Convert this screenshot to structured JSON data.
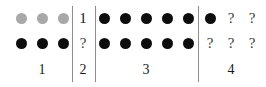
{
  "figure": {
    "title": "",
    "background_color": "#ffffff",
    "colors": {
      "dot_black": "#0d0d0d",
      "dot_gray": "#a8a8a8",
      "rule": "#8d8d8d",
      "text": "#1a1a1a"
    },
    "rows": 2,
    "separator_count": 3
  },
  "groups": [
    {
      "label": "1",
      "top_row": [
        {
          "kind": "dot",
          "shade": "gray"
        },
        {
          "kind": "dot",
          "shade": "gray"
        },
        {
          "kind": "dot",
          "shade": "gray"
        }
      ],
      "bottom_row": [
        {
          "kind": "dot",
          "shade": "black"
        },
        {
          "kind": "dot",
          "shade": "black"
        },
        {
          "kind": "dot",
          "shade": "black"
        }
      ]
    },
    {
      "label": "2",
      "top_row": [
        {
          "kind": "text",
          "text": "1"
        }
      ],
      "bottom_row": [
        {
          "kind": "text",
          "text": "?"
        }
      ]
    },
    {
      "label": "3",
      "top_row": [
        {
          "kind": "dot",
          "shade": "black"
        },
        {
          "kind": "dot",
          "shade": "black"
        },
        {
          "kind": "dot",
          "shade": "black"
        },
        {
          "kind": "dot",
          "shade": "black"
        },
        {
          "kind": "dot",
          "shade": "black"
        }
      ],
      "bottom_row": [
        {
          "kind": "dot",
          "shade": "black"
        },
        {
          "kind": "dot",
          "shade": "black"
        },
        {
          "kind": "dot",
          "shade": "black"
        },
        {
          "kind": "dot",
          "shade": "black"
        },
        {
          "kind": "dot",
          "shade": "black"
        }
      ]
    },
    {
      "label": "4",
      "top_row": [
        {
          "kind": "dot",
          "shade": "black"
        },
        {
          "kind": "text",
          "text": "?"
        },
        {
          "kind": "text",
          "text": "?"
        }
      ],
      "bottom_row": [
        {
          "kind": "text",
          "text": "?"
        },
        {
          "kind": "text",
          "text": "?"
        },
        {
          "kind": "text",
          "text": "?"
        }
      ]
    }
  ],
  "layout": {
    "group_x": [
      14,
      72,
      100,
      202
    ],
    "group_width": [
      56,
      22,
      92,
      58
    ],
    "separators_x": [
      72,
      95,
      198
    ],
    "separator_top": 6,
    "separator_bottom": 82,
    "row_top_y": 13,
    "row_bottom_y": 38,
    "label_y": 63,
    "dot_diameter": 11,
    "dot_gap": 10
  }
}
